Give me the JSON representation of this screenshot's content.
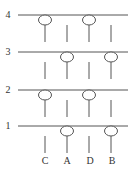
{
  "diagram": {
    "row_labels": [
      "4",
      "3",
      "2",
      "1"
    ],
    "column_labels": [
      "C",
      "A",
      "D",
      "B"
    ],
    "line_color": "#555555",
    "rows": [
      {
        "label": "4",
        "y": 15,
        "circles_at": [
          "C",
          "D"
        ]
      },
      {
        "label": "3",
        "y": 52,
        "circles_at": [
          "A",
          "B"
        ]
      },
      {
        "label": "2",
        "y": 90,
        "circles_at": [
          "C",
          "D"
        ]
      },
      {
        "label": "1",
        "y": 126,
        "circles_at": [
          "A",
          "B"
        ]
      }
    ],
    "columns": [
      {
        "label": "C",
        "x": 45
      },
      {
        "label": "A",
        "x": 67
      },
      {
        "label": "D",
        "x": 89
      },
      {
        "label": "B",
        "x": 111
      }
    ]
  }
}
